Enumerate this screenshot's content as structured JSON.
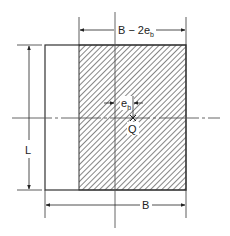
{
  "figure": {
    "colors": {
      "line": "#333333",
      "centerline": "#555555",
      "hatch": "#444444",
      "background": "#ffffff"
    }
  },
  "labels": {
    "effective_width": "B − 2e",
    "effective_width_sub": "b",
    "eccentricity": "e",
    "eccentricity_sub": "b",
    "load": "Q",
    "length": "L",
    "width": "B"
  }
}
